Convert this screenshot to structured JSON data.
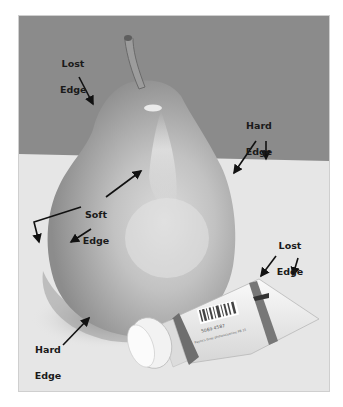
{
  "figure": {
    "colors": {
      "wall": "#8b8b8b",
      "table": "#e6e6e6",
      "pear_shadow_side": "#8e8e8e",
      "pear_light": "#d2d2d2",
      "arrow": "#111111"
    },
    "annotations": [
      {
        "id": "lost-edge-top",
        "line1": "Lost",
        "line2": "Edge"
      },
      {
        "id": "hard-edge-right",
        "line1": "Hard",
        "line2": "Edge"
      },
      {
        "id": "soft-edge",
        "line1": "Soft",
        "line2": "Edge"
      },
      {
        "id": "lost-edge-tube",
        "line1": "Lost",
        "line2": "Edge"
      },
      {
        "id": "hard-edge-bottom",
        "line1": "Hard",
        "line2": "Edge"
      }
    ],
    "tube": {
      "barcode_digits": "5069 4587",
      "label_text": "Payne's Gray phthalocyanine PB 15"
    }
  }
}
